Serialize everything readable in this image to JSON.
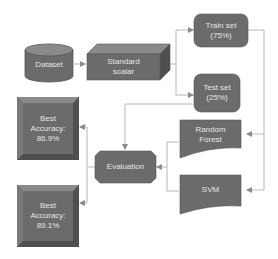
{
  "diagram": {
    "type": "flowchart",
    "colors": {
      "node_fill": "#6b6b6b",
      "node_dark": "#4f4f4f",
      "node_light": "#8a8a8a",
      "text": "#e6e6e6",
      "connector": "#b8b8b8"
    },
    "nodes": {
      "dataset": {
        "label": "Dataset",
        "shape": "cylinder"
      },
      "standard_scalar": {
        "label": "Standard\nscalar",
        "shape": "cube"
      },
      "train_set": {
        "label": "Train set\n(75%)",
        "shape": "rounded-rect"
      },
      "test_set": {
        "label": "Test set\n(25%)",
        "shape": "rounded-rect"
      },
      "random_forest": {
        "label": "Random\nForest",
        "shape": "document"
      },
      "svm": {
        "label": "SVM",
        "shape": "document"
      },
      "evaluation": {
        "label": "Evaluation",
        "shape": "octagon"
      },
      "best_acc_1": {
        "label": "Best\nAccuracy:\n86.9%",
        "shape": "bevel"
      },
      "best_acc_2": {
        "label": "Best\nAccuracy:\n89.1%",
        "shape": "bevel"
      }
    },
    "edges": [
      {
        "from": "Dataset",
        "to": "Standard scalar"
      },
      {
        "from": "Standard scalar",
        "to": "Train set (75%)"
      },
      {
        "from": "Standard scalar",
        "to": "Test set (25%)"
      },
      {
        "from": "Train set (75%)",
        "to": "Random Forest"
      },
      {
        "from": "Train set (75%)",
        "to": "SVM"
      },
      {
        "from": "Test set (25%)",
        "to": "Evaluation"
      },
      {
        "from": "Random Forest",
        "to": "Evaluation"
      },
      {
        "from": "SVM",
        "to": "Evaluation"
      },
      {
        "from": "Evaluation",
        "to": "Best Accuracy: 86.9%"
      },
      {
        "from": "Evaluation",
        "to": "Best Accuracy: 89.1%"
      }
    ]
  }
}
